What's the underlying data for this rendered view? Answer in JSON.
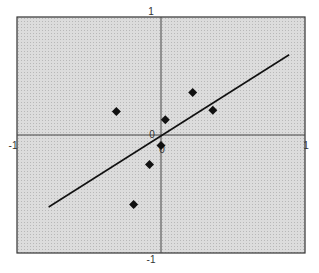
{
  "chart_data": {
    "type": "scatter",
    "title": "",
    "xlabel": "",
    "ylabel": "",
    "xlim": [
      -1,
      1
    ],
    "ylim": [
      -1,
      1
    ],
    "grid": true,
    "legend": null,
    "tick_labels": {
      "top": "1",
      "bottom": "-1",
      "left": "-1",
      "right": "1",
      "origin_x": "0",
      "origin_y": "0"
    },
    "series": [
      {
        "name": "points",
        "marker": "diamond",
        "color": "#111111",
        "points": [
          {
            "x": -0.31,
            "y": 0.2
          },
          {
            "x": 0.22,
            "y": 0.36
          },
          {
            "x": 0.36,
            "y": 0.21
          },
          {
            "x": 0.03,
            "y": 0.13
          },
          {
            "x": 0.0,
            "y": -0.09
          },
          {
            "x": -0.08,
            "y": -0.25
          },
          {
            "x": -0.19,
            "y": -0.59
          }
        ]
      },
      {
        "name": "fit-line",
        "type": "line",
        "color": "#111111",
        "points": [
          {
            "x": -0.78,
            "y": -0.61
          },
          {
            "x": 0.89,
            "y": 0.68
          }
        ]
      }
    ]
  },
  "style": {
    "plot_background": "#d4d4d4",
    "frame_color": "#333333",
    "axis_color": "#444444",
    "marker_color": "#111111"
  }
}
